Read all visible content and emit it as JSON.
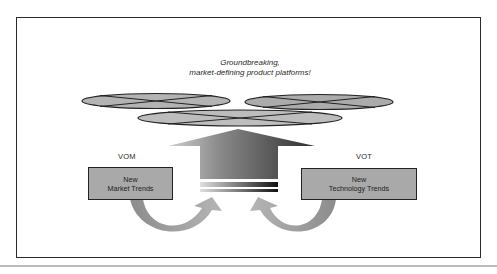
{
  "diagram": {
    "caption": {
      "line1": "Groundbreaking,",
      "line2": "market-defining product platforms!"
    },
    "left": {
      "label": "VOM",
      "box_line1": "New",
      "box_line2": "Market Trends"
    },
    "right": {
      "label": "VOT",
      "box_line1": "New",
      "box_line2": "Technology Trends"
    },
    "platforms": [
      {
        "name": "platform-left"
      },
      {
        "name": "platform-right"
      },
      {
        "name": "platform-center"
      }
    ],
    "colors": {
      "platform_fill": "#b3b3b3",
      "box_fill": "#a9a9a9",
      "outline": "#222222",
      "arrow_dark": "#3a3a3a",
      "arrow_light": "#c8c8c8"
    }
  }
}
